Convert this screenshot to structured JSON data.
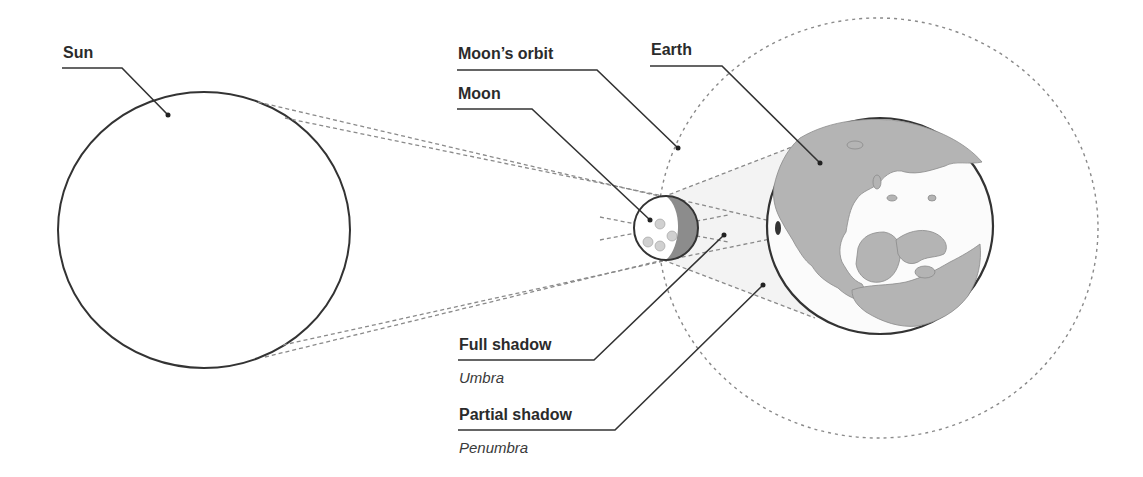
{
  "labels": {
    "sun": "Sun",
    "moons_orbit": "Moon’s orbit",
    "moon": "Moon",
    "earth": "Earth",
    "full_shadow": "Full shadow",
    "umbra": "Umbra",
    "partial_shadow": "Partial shadow",
    "penumbra": "Penumbra"
  },
  "colors": {
    "outline": "#333333",
    "ray": "#8a8a8a",
    "land": "#b4b4b4",
    "moon_dark_side": "#8c8c8c",
    "umbra_fill": "#e4e4e4",
    "background": "#ffffff"
  }
}
